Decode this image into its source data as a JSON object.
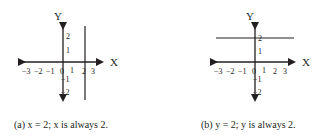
{
  "figures": [
    {
      "id": "a",
      "axis_x_label": "X",
      "axis_y_label": "Y",
      "x_ticks": [
        "−3",
        "−2",
        "−1",
        "0",
        "1",
        "2",
        "3"
      ],
      "y_ticks_pos": [
        "2",
        "1"
      ],
      "y_ticks_neg": [
        "−1",
        "−2"
      ],
      "line": "vertical line at x = 2",
      "caption": "(a) x = 2; x is always 2."
    },
    {
      "id": "b",
      "axis_x_label": "X",
      "axis_y_label": "Y",
      "x_ticks": [
        "−3",
        "−2",
        "−1",
        "0",
        "1",
        "2",
        "3"
      ],
      "y_ticks_pos": [
        "2",
        "1"
      ],
      "y_ticks_neg": [
        "−1",
        "−2"
      ],
      "line": "horizontal line at y = 2",
      "caption": "(b) y = 2; y is always 2."
    }
  ],
  "colors": {
    "ink": "#231f20",
    "background": "#ffffff"
  }
}
